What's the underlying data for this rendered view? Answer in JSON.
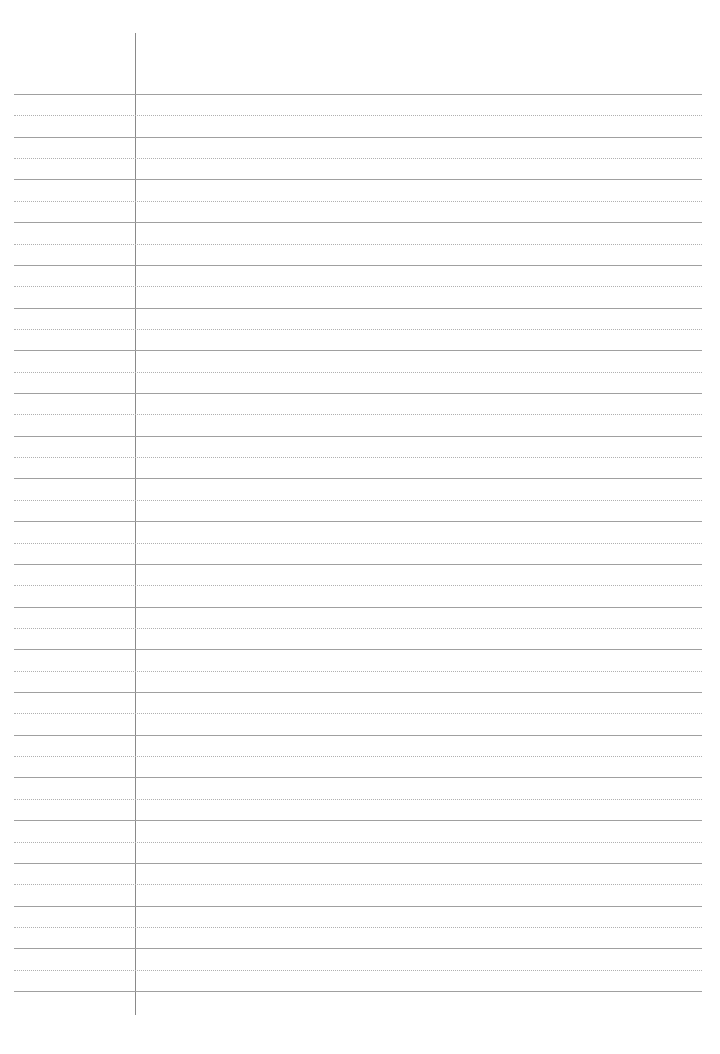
{
  "page": {
    "type": "lined-paper",
    "background_color": "#ffffff",
    "rule_color": "#a0a0a0",
    "dotted_rule_color": "#b0b0b0",
    "margin_line_color": "#8a8a8a",
    "solid_rule_count": 22,
    "dotted_rule_count": 21
  }
}
